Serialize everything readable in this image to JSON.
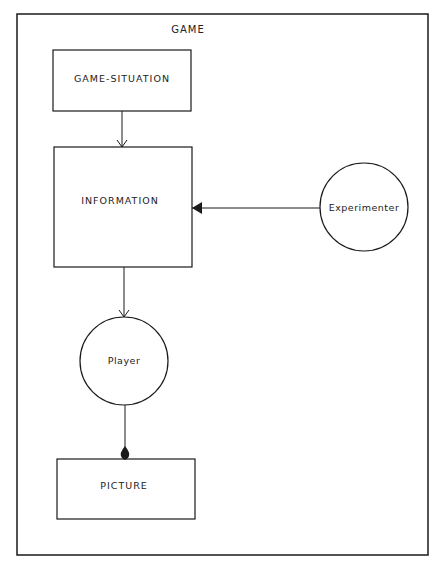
{
  "diagram": {
    "frame_label": "GAME",
    "nodes": {
      "game_situation": "GAME-SITUATION",
      "information": "INFORMATION",
      "experimenter": "Experimenter",
      "player": "Player",
      "picture": "PICTURE"
    },
    "edges": [
      {
        "from": "GAME-SITUATION",
        "to": "INFORMATION",
        "arrow": "open"
      },
      {
        "from": "Experimenter",
        "to": "INFORMATION",
        "arrow": "filled-triangle"
      },
      {
        "from": "INFORMATION",
        "to": "Player",
        "arrow": "open"
      },
      {
        "from": "Player",
        "to": "PICTURE",
        "arrow": "filled-teardrop"
      }
    ],
    "colors": {
      "stroke": "#1a1a1a",
      "background": "#ffffff"
    }
  }
}
